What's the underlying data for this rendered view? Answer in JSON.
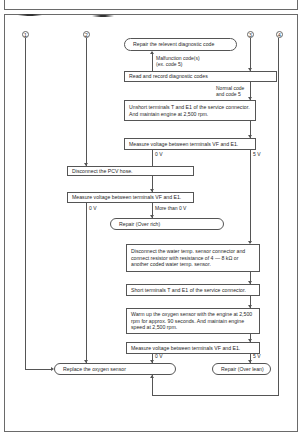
{
  "connectors": {
    "c1": "1",
    "c2": "2",
    "c3": "3",
    "c4": "4"
  },
  "steps": {
    "repair_code": "Repair the relevent diagnostic code",
    "malfunction_label_1": "Malfunction code(s)",
    "malfunction_label_2": "(ex. code 5)",
    "read_codes": "Read and record diagnostic codes",
    "normal_label_1": "Normal code",
    "normal_label_2": "and code 5",
    "unshort": "Unshort terminals T and E1 of the service connector. And maintain engine at 2,500 rpm.",
    "measure_1": "Measure voltage between terminals VF and E1.",
    "measure_1_0v": "0 V",
    "measure_1_5v": "5 V",
    "disconnect_pcv": "Disconnect the PCV hose.",
    "measure_2": "Measure voltage between terminals VF and E1.",
    "measure_2_0v": "0 V",
    "measure_2_more": "More than 0 V",
    "repair_rich": "Repair (Over rich)",
    "disconnect_water": "Disconnect the water temp. sensor connector and connect resistor with resistance of 4 — 8 kΩ or another coded water temp. sensor.",
    "short_terminals": "Short terminals T and E1 of the service connector.",
    "warm_up": "Warm up the oxygen sensor with the engine at 2,500 rpm for approx. 90 seconds. And maintain engine speed at 2,500 rpm.",
    "measure_3": "Measure voltage between terminals VF and E1.",
    "measure_3_0v": "0 V",
    "measure_3_5v": "5 V",
    "replace_o2": "Replace the oxygen sensor",
    "repair_lean": "Repair (Over lean)"
  }
}
